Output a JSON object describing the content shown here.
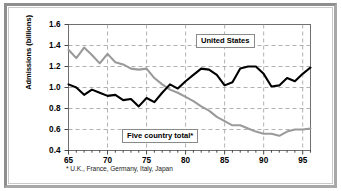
{
  "chart_data": {
    "type": "line",
    "title": "",
    "xlabel": "",
    "ylabel": "Admissions (billions)",
    "xlim": [
      65,
      96
    ],
    "ylim": [
      0.4,
      1.6
    ],
    "xticks": [
      "65",
      "70",
      "75",
      "80",
      "85",
      "90",
      "95"
    ],
    "xtick_values": [
      65,
      70,
      75,
      80,
      85,
      90,
      95
    ],
    "yticks": [
      "0.4",
      "0.6",
      "0.8",
      "1.0",
      "1.2",
      "1.4",
      "1.6"
    ],
    "ytick_values": [
      0.4,
      0.6,
      0.8,
      1.0,
      1.2,
      1.4,
      1.6
    ],
    "grid": "dashed-both",
    "legend_position": "inline-annotations",
    "x": [
      65,
      66,
      67,
      68,
      69,
      70,
      71,
      72,
      73,
      74,
      75,
      76,
      77,
      78,
      79,
      80,
      81,
      82,
      83,
      84,
      85,
      86,
      87,
      88,
      89,
      90,
      91,
      92,
      93,
      94,
      95,
      96
    ],
    "series": [
      {
        "name": "United States",
        "color": "#000000",
        "values": [
          1.03,
          1.0,
          0.93,
          0.98,
          0.95,
          0.92,
          0.93,
          0.88,
          0.89,
          0.82,
          0.9,
          0.86,
          0.95,
          1.03,
          0.99,
          1.06,
          1.12,
          1.18,
          1.17,
          1.12,
          1.02,
          1.05,
          1.18,
          1.2,
          1.2,
          1.13,
          1.01,
          1.02,
          1.09,
          1.06,
          1.13,
          1.19
        ]
      },
      {
        "name": "Five country total*",
        "color": "#9a9a9a",
        "values": [
          1.36,
          1.28,
          1.38,
          1.31,
          1.23,
          1.32,
          1.24,
          1.22,
          1.18,
          1.17,
          1.18,
          1.09,
          1.03,
          0.98,
          0.95,
          0.91,
          0.87,
          0.82,
          0.78,
          0.72,
          0.68,
          0.64,
          0.64,
          0.61,
          0.58,
          0.56,
          0.56,
          0.54,
          0.58,
          0.6,
          0.6,
          0.61
        ]
      }
    ],
    "annotations": [
      {
        "text": "United States",
        "series": "United States"
      },
      {
        "text": "Five country total*",
        "series": "Five country total*"
      }
    ],
    "footnote": "* U.K., France, Germany, Italy, Japan"
  },
  "axis": {
    "y_title": "Admissions (billions)"
  },
  "labels": {
    "united_states": "United States",
    "five_country": "Five country total*"
  },
  "footnote": "* U.K., France, Germany, Italy, Japan"
}
